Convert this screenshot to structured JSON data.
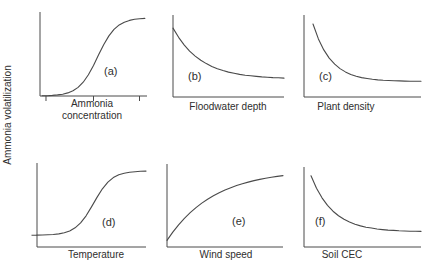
{
  "figure": {
    "y_axis_label": "Ammonia volatilization",
    "background": "#ffffff",
    "line_color": "#4a4a4a",
    "text_color": "#2e2e2e"
  },
  "chart_data": [
    {
      "panel": "a",
      "type": "line",
      "label": "(a)",
      "xlabel": "Ammonia concentration",
      "ylabel": "Ammonia volatilization",
      "trend": "sigmoidal increase: near zero at low concentration, steep rise, plateau at high concentration",
      "axes_quantitative": false,
      "x_range": [
        0,
        1
      ],
      "y_range": [
        0,
        1
      ],
      "x_ticks": [
        0.056,
        0.5,
        0.93
      ],
      "y_ticks": [],
      "x": [
        0.02,
        0.068,
        0.116,
        0.164,
        0.212,
        0.26,
        0.308,
        0.356,
        0.404,
        0.452,
        0.5,
        0.548,
        0.596,
        0.644,
        0.692,
        0.74,
        0.788,
        0.836,
        0.884,
        0.932,
        0.98
      ],
      "y": [
        0.002,
        0.004,
        0.007,
        0.013,
        0.022,
        0.037,
        0.062,
        0.102,
        0.164,
        0.252,
        0.364,
        0.49,
        0.613,
        0.716,
        0.793,
        0.846,
        0.879,
        0.9,
        0.913,
        0.92,
        0.924
      ]
    },
    {
      "panel": "b",
      "type": "line",
      "label": "(b)",
      "xlabel": "Floodwater depth",
      "ylabel": "Ammonia volatilization",
      "trend": "monotonic decrease from high value, leveling to low plateau",
      "axes_quantitative": false,
      "x_range": [
        0,
        1
      ],
      "y_range": [
        0,
        1
      ],
      "x_ticks": [],
      "y_ticks": [],
      "x": [
        0,
        0.05,
        0.1,
        0.15,
        0.2,
        0.25,
        0.3,
        0.35,
        0.4,
        0.45,
        0.5,
        0.55,
        0.6,
        0.65,
        0.7,
        0.75,
        0.8,
        0.85,
        0.9,
        0.95,
        1
      ],
      "y": [
        0.84,
        0.728,
        0.636,
        0.56,
        0.499,
        0.448,
        0.407,
        0.373,
        0.345,
        0.323,
        0.304,
        0.289,
        0.276,
        0.266,
        0.258,
        0.251,
        0.245,
        0.241,
        0.237,
        0.234,
        0.231
      ]
    },
    {
      "panel": "c",
      "type": "line",
      "label": "(c)",
      "xlabel": "Plant density",
      "ylabel": "Ammonia volatilization",
      "trend": "steep exponential-like decay to low plateau",
      "axes_quantitative": false,
      "x_range": [
        0,
        1
      ],
      "y_range": [
        0,
        1
      ],
      "x_ticks": [],
      "y_ticks": [],
      "x": [
        0.077,
        0.123,
        0.169,
        0.215,
        0.262,
        0.308,
        0.354,
        0.4,
        0.446,
        0.492,
        0.539,
        0.585,
        0.631,
        0.677,
        0.723,
        0.769,
        0.815,
        0.862,
        0.908,
        0.954,
        1
      ],
      "y": [
        0.89,
        0.709,
        0.574,
        0.475,
        0.401,
        0.346,
        0.306,
        0.276,
        0.254,
        0.237,
        0.225,
        0.216,
        0.209,
        0.204,
        0.201,
        0.198,
        0.196,
        0.194,
        0.193,
        0.192,
        0.192
      ]
    },
    {
      "panel": "d",
      "type": "line",
      "label": "(d)",
      "xlabel": "Temperature",
      "ylabel": "Ammonia volatilization",
      "trend": "sigmoidal increase: low flat baseline, steep rise, plateau at high temperature",
      "axes_quantitative": false,
      "x_range": [
        0,
        1
      ],
      "y_range": [
        0,
        1
      ],
      "x_ticks": [],
      "y_ticks": [
        0.14
      ],
      "x": [
        0,
        0.05,
        0.1,
        0.15,
        0.2,
        0.25,
        0.3,
        0.35,
        0.4,
        0.45,
        0.5,
        0.55,
        0.6,
        0.65,
        0.7,
        0.75,
        0.8,
        0.85,
        0.9,
        0.95,
        1
      ],
      "y": [
        0.142,
        0.143,
        0.145,
        0.149,
        0.156,
        0.169,
        0.191,
        0.228,
        0.287,
        0.371,
        0.477,
        0.591,
        0.693,
        0.772,
        0.826,
        0.86,
        0.879,
        0.891,
        0.897,
        0.901,
        0.903
      ]
    },
    {
      "panel": "e",
      "type": "line",
      "label": "(e)",
      "xlabel": "Wind speed",
      "ylabel": "Ammonia volatilization",
      "trend": "concave-down saturating increase with wind speed",
      "axes_quantitative": false,
      "x_range": [
        0,
        1
      ],
      "y_range": [
        0,
        1
      ],
      "x_ticks": [],
      "y_ticks": [],
      "x": [
        0,
        0.05,
        0.1,
        0.15,
        0.2,
        0.25,
        0.3,
        0.35,
        0.4,
        0.45,
        0.5,
        0.55,
        0.6,
        0.65,
        0.7,
        0.75,
        0.8,
        0.85,
        0.9,
        0.95,
        1
      ],
      "y": [
        0.08,
        0.18,
        0.268,
        0.346,
        0.415,
        0.475,
        0.529,
        0.576,
        0.617,
        0.654,
        0.687,
        0.715,
        0.74,
        0.763,
        0.782,
        0.8,
        0.815,
        0.829,
        0.84,
        0.851,
        0.86
      ]
    },
    {
      "panel": "f",
      "type": "line",
      "label": "(f)",
      "xlabel": "Soil CEC",
      "ylabel": "Ammonia volatilization",
      "trend": "exponential-like decay to low plateau with increasing soil CEC",
      "axes_quantitative": false,
      "x_range": [
        0,
        1
      ],
      "y_range": [
        0,
        1
      ],
      "x_ticks": [],
      "y_ticks": [],
      "x": [
        0.06,
        0.107,
        0.154,
        0.201,
        0.248,
        0.295,
        0.342,
        0.389,
        0.436,
        0.483,
        0.53,
        0.577,
        0.624,
        0.671,
        0.718,
        0.765,
        0.812,
        0.859,
        0.906,
        0.953,
        1
      ],
      "y": [
        0.89,
        0.735,
        0.615,
        0.521,
        0.448,
        0.391,
        0.346,
        0.312,
        0.285,
        0.264,
        0.247,
        0.237,
        0.225,
        0.217,
        0.211,
        0.207,
        0.203,
        0.2,
        0.198,
        0.196,
        0.195
      ]
    }
  ]
}
